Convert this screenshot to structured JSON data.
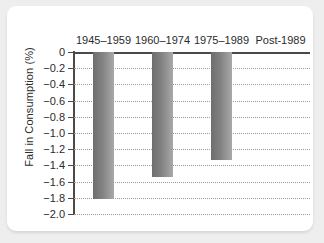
{
  "chart_data": {
    "type": "bar",
    "title": "",
    "subtitle": "",
    "xlabel": "",
    "ylabel": "Fall in Consumption (%)",
    "categories": [
      "1945–1959",
      "1960–1974",
      "1975–1989",
      "Post-1989"
    ],
    "values": [
      -1.82,
      -1.54,
      -1.33,
      0
    ],
    "ylim": [
      -2.0,
      0
    ],
    "yticks": [
      0,
      -0.2,
      -0.4,
      -0.6,
      -0.8,
      -1.0,
      -1.2,
      -1.4,
      -1.6,
      -1.8,
      -2.0
    ],
    "ytick_labels": [
      "0",
      "−0.2",
      "−0.4",
      "−0.6",
      "−0.8",
      "−1.0",
      "−1.2",
      "−1.4",
      "−1.6",
      "−1.8",
      "−2.0"
    ],
    "grid": true,
    "grid_style": "dotted",
    "legend": null,
    "legend_position": "none",
    "category_label_position": "top",
    "bar_color_start": "#6e6e6e",
    "bar_color_end": "#a9a9a9",
    "grid_color": "#9a9a9a",
    "axis_color": "#4a4a4a",
    "text_color": "#2b2b2b",
    "background_color": "#ffffff",
    "page_background_color": "#eeeeee"
  }
}
